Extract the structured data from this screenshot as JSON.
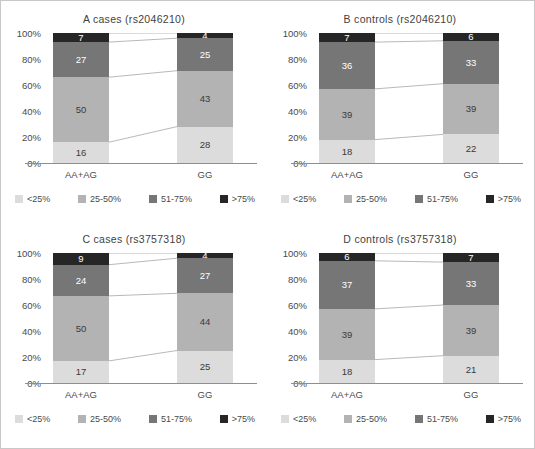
{
  "figure": {
    "background": "#ffffff",
    "border_color": "#c8c8c8"
  },
  "axis": {
    "y_ticks": [
      "100%",
      "80%",
      "60%",
      "40%",
      "20%",
      "0%"
    ],
    "y_values": [
      100,
      80,
      60,
      40,
      20,
      0
    ],
    "x_categories": [
      "AA+AG",
      "GG"
    ]
  },
  "legend": {
    "items": [
      {
        "label": "<25%",
        "color": "#dcdcdc"
      },
      {
        "label": "25-50%",
        "color": "#b3b3b3"
      },
      {
        "label": "51-75%",
        "color": "#767676"
      },
      {
        "label": ">75%",
        "color": "#262626"
      }
    ]
  },
  "panels": [
    {
      "id": "A",
      "title": "A  cases  (rs2046210)",
      "bars": [
        {
          "category": "AA+AG",
          "segments": [
            {
              "key": "lt25",
              "label": "16",
              "value": 16
            },
            {
              "key": "25_50",
              "label": "50",
              "value": 50
            },
            {
              "key": "51_75",
              "label": "27",
              "value": 27
            },
            {
              "key": "gt75",
              "label": "7",
              "value": 7
            }
          ]
        },
        {
          "category": "GG",
          "segments": [
            {
              "key": "lt25",
              "label": "28",
              "value": 28
            },
            {
              "key": "25_50",
              "label": "43",
              "value": 43
            },
            {
              "key": "51_75",
              "label": "25",
              "value": 25
            },
            {
              "key": "gt75",
              "label": "4",
              "value": 4
            }
          ]
        }
      ]
    },
    {
      "id": "B",
      "title": "B  controls  (rs2046210)",
      "bars": [
        {
          "category": "AA+AG",
          "segments": [
            {
              "key": "lt25",
              "label": "18",
              "value": 18
            },
            {
              "key": "25_50",
              "label": "39",
              "value": 39
            },
            {
              "key": "51_75",
              "label": "36",
              "value": 36
            },
            {
              "key": "gt75",
              "label": "7",
              "value": 7
            }
          ]
        },
        {
          "category": "GG",
          "segments": [
            {
              "key": "lt25",
              "label": "22",
              "value": 22
            },
            {
              "key": "25_50",
              "label": "39",
              "value": 39
            },
            {
              "key": "51_75",
              "label": "33",
              "value": 33
            },
            {
              "key": "gt75",
              "label": "6",
              "value": 6
            }
          ]
        }
      ]
    },
    {
      "id": "C",
      "title": "C  cases  (rs3757318)",
      "bars": [
        {
          "category": "AA+AG",
          "segments": [
            {
              "key": "lt25",
              "label": "17",
              "value": 17
            },
            {
              "key": "25_50",
              "label": "50",
              "value": 50
            },
            {
              "key": "51_75",
              "label": "24",
              "value": 24
            },
            {
              "key": "gt75",
              "label": "9",
              "value": 9
            }
          ]
        },
        {
          "category": "GG",
          "segments": [
            {
              "key": "lt25",
              "label": "25",
              "value": 25
            },
            {
              "key": "25_50",
              "label": "44",
              "value": 44
            },
            {
              "key": "51_75",
              "label": "27",
              "value": 27
            },
            {
              "key": "gt75",
              "label": "4",
              "value": 4
            }
          ]
        }
      ]
    },
    {
      "id": "D",
      "title": "D  controls  (rs3757318)",
      "bars": [
        {
          "category": "AA+AG",
          "segments": [
            {
              "key": "lt25",
              "label": "18",
              "value": 18
            },
            {
              "key": "25_50",
              "label": "39",
              "value": 39
            },
            {
              "key": "51_75",
              "label": "37",
              "value": 37
            },
            {
              "key": "gt75",
              "label": "6",
              "value": 6
            }
          ]
        },
        {
          "category": "GG",
          "segments": [
            {
              "key": "lt25",
              "label": "21",
              "value": 21
            },
            {
              "key": "25_50",
              "label": "39",
              "value": 39
            },
            {
              "key": "51_75",
              "label": "33",
              "value": 33
            },
            {
              "key": "gt75",
              "label": "7",
              "value": 7
            }
          ]
        }
      ]
    }
  ],
  "chart_data": {
    "type": "bar",
    "subtype": "100% stacked bar with linked cumulative connectors",
    "title": "",
    "xlabel": "",
    "ylabel": "",
    "ylim": [
      0,
      100
    ],
    "grid": false,
    "legend_position": "below-plot",
    "categories": [
      "AA+AG",
      "GG"
    ],
    "stack_order_bottom_to_top": [
      "<25%",
      "25-50%",
      "51-75%",
      ">75%"
    ],
    "panels": [
      {
        "id": "A",
        "title": "A  cases  (rs2046210)",
        "series": [
          {
            "name": "<25%",
            "values": [
              16,
              28
            ]
          },
          {
            "name": "25-50%",
            "values": [
              50,
              43
            ]
          },
          {
            "name": "51-75%",
            "values": [
              27,
              25
            ]
          },
          {
            "name": ">75%",
            "values": [
              7,
              4
            ]
          }
        ]
      },
      {
        "id": "B",
        "title": "B  controls  (rs2046210)",
        "series": [
          {
            "name": "<25%",
            "values": [
              18,
              22
            ]
          },
          {
            "name": "25-50%",
            "values": [
              39,
              39
            ]
          },
          {
            "name": "51-75%",
            "values": [
              36,
              33
            ]
          },
          {
            "name": ">75%",
            "values": [
              7,
              6
            ]
          }
        ]
      },
      {
        "id": "C",
        "title": "C  cases  (rs3757318)",
        "series": [
          {
            "name": "<25%",
            "values": [
              17,
              25
            ]
          },
          {
            "name": "25-50%",
            "values": [
              50,
              44
            ]
          },
          {
            "name": "51-75%",
            "values": [
              24,
              27
            ]
          },
          {
            "name": ">75%",
            "values": [
              9,
              4
            ]
          }
        ]
      },
      {
        "id": "D",
        "title": "D  controls  (rs3757318)",
        "series": [
          {
            "name": "<25%",
            "values": [
              18,
              21
            ]
          },
          {
            "name": "25-50%",
            "values": [
              39,
              39
            ]
          },
          {
            "name": "51-75%",
            "values": [
              37,
              33
            ]
          },
          {
            "name": ">75%",
            "values": [
              6,
              7
            ]
          }
        ]
      }
    ]
  }
}
